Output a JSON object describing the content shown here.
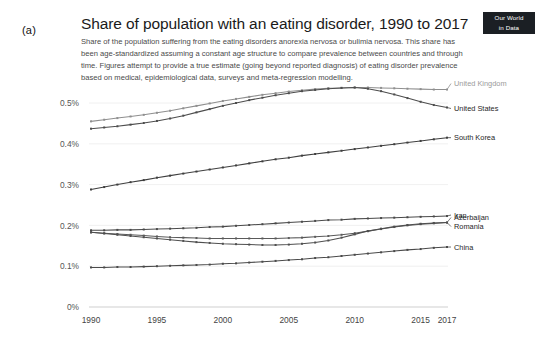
{
  "panel": {
    "label": "(a)"
  },
  "badge": {
    "line1": "Our World",
    "line2": "in Data"
  },
  "header": {
    "title": "Share of population with an eating disorder, 1990 to 2017",
    "subtitle": "Share of the population suffering from the eating disorders anorexia nervosa or bulimia nervosa. This share has been age-standardized assuming a constant age structure to compare prevalence between countries and through time. Figures attempt to provide a true estimate (going beyond reported diagnosis) of eating disorder prevalence based on medical, epidemiological data, surveys and meta-regression modelling."
  },
  "chart_data": {
    "type": "line",
    "title": "Share of population with an eating disorder, 1990 to 2017",
    "xlabel": "",
    "ylabel": "",
    "xlim": [
      1990,
      2017
    ],
    "ylim": [
      0,
      0.5
    ],
    "grid": true,
    "legend_position": "right-inline",
    "y_ticks": [
      0,
      0.1,
      0.2,
      0.3,
      0.4,
      0.5
    ],
    "y_tick_labels": [
      "0%",
      "0.1%",
      "0.2%",
      "0.3%",
      "0.4%",
      "0.5%"
    ],
    "x_ticks": [
      1990,
      1995,
      2000,
      2005,
      2010,
      2015,
      2017
    ],
    "x_tick_labels": [
      "1990",
      "1995",
      "2000",
      "2005",
      "2010",
      "2015",
      "2017"
    ],
    "x": [
      1990,
      1991,
      1992,
      1993,
      1994,
      1995,
      1996,
      1997,
      1998,
      1999,
      2000,
      2001,
      2002,
      2003,
      2004,
      2005,
      2006,
      2007,
      2008,
      2009,
      2010,
      2011,
      2012,
      2013,
      2014,
      2015,
      2016,
      2017
    ],
    "series": [
      {
        "name": "United Kingdom",
        "color": "#8f8f8f",
        "label_color": "#9a9a9a",
        "values": [
          0.455,
          0.459,
          0.463,
          0.467,
          0.471,
          0.476,
          0.481,
          0.487,
          0.493,
          0.499,
          0.505,
          0.51,
          0.515,
          0.52,
          0.524,
          0.528,
          0.531,
          0.534,
          0.536,
          0.537,
          0.538,
          0.538,
          0.537,
          0.536,
          0.535,
          0.534,
          0.533,
          0.533
        ]
      },
      {
        "name": "United States",
        "color": "#4d4d4d",
        "label_color": "#262626",
        "values": [
          0.437,
          0.44,
          0.443,
          0.447,
          0.451,
          0.456,
          0.462,
          0.469,
          0.477,
          0.485,
          0.493,
          0.5,
          0.507,
          0.513,
          0.519,
          0.524,
          0.529,
          0.532,
          0.535,
          0.537,
          0.538,
          0.535,
          0.529,
          0.521,
          0.512,
          0.503,
          0.495,
          0.489
        ]
      },
      {
        "name": "South Korea",
        "color": "#3f3f3f",
        "label_color": "#262626",
        "values": [
          0.288,
          0.294,
          0.3,
          0.306,
          0.311,
          0.317,
          0.322,
          0.327,
          0.332,
          0.337,
          0.342,
          0.347,
          0.352,
          0.357,
          0.362,
          0.366,
          0.371,
          0.375,
          0.379,
          0.383,
          0.387,
          0.391,
          0.395,
          0.399,
          0.403,
          0.407,
          0.411,
          0.415
        ]
      },
      {
        "name": "Iran",
        "color": "#4a4a4a",
        "label_color": "#262626",
        "values": [
          0.188,
          0.188,
          0.189,
          0.189,
          0.19,
          0.191,
          0.192,
          0.193,
          0.194,
          0.196,
          0.197,
          0.199,
          0.201,
          0.203,
          0.205,
          0.207,
          0.209,
          0.211,
          0.213,
          0.214,
          0.216,
          0.217,
          0.218,
          0.219,
          0.22,
          0.221,
          0.222,
          0.223
        ]
      },
      {
        "name": "Azerbaijan",
        "color": "#5a5a5a",
        "label_color": "#262626",
        "values": [
          0.183,
          0.181,
          0.179,
          0.177,
          0.175,
          0.173,
          0.171,
          0.17,
          0.169,
          0.168,
          0.168,
          0.168,
          0.168,
          0.168,
          0.168,
          0.169,
          0.17,
          0.172,
          0.174,
          0.177,
          0.181,
          0.186,
          0.191,
          0.196,
          0.2,
          0.203,
          0.205,
          0.207
        ]
      },
      {
        "name": "Romania",
        "color": "#4f4f4f",
        "label_color": "#262626",
        "values": [
          0.183,
          0.18,
          0.177,
          0.174,
          0.171,
          0.168,
          0.165,
          0.162,
          0.159,
          0.157,
          0.155,
          0.154,
          0.153,
          0.152,
          0.152,
          0.153,
          0.155,
          0.158,
          0.163,
          0.17,
          0.178,
          0.186,
          0.192,
          0.197,
          0.201,
          0.204,
          0.206,
          0.207
        ]
      },
      {
        "name": "China",
        "color": "#4a4a4a",
        "label_color": "#262626",
        "values": [
          0.097,
          0.097,
          0.098,
          0.098,
          0.099,
          0.1,
          0.101,
          0.102,
          0.103,
          0.104,
          0.106,
          0.107,
          0.109,
          0.111,
          0.113,
          0.115,
          0.117,
          0.12,
          0.122,
          0.125,
          0.128,
          0.131,
          0.134,
          0.137,
          0.14,
          0.142,
          0.145,
          0.147
        ]
      }
    ]
  }
}
